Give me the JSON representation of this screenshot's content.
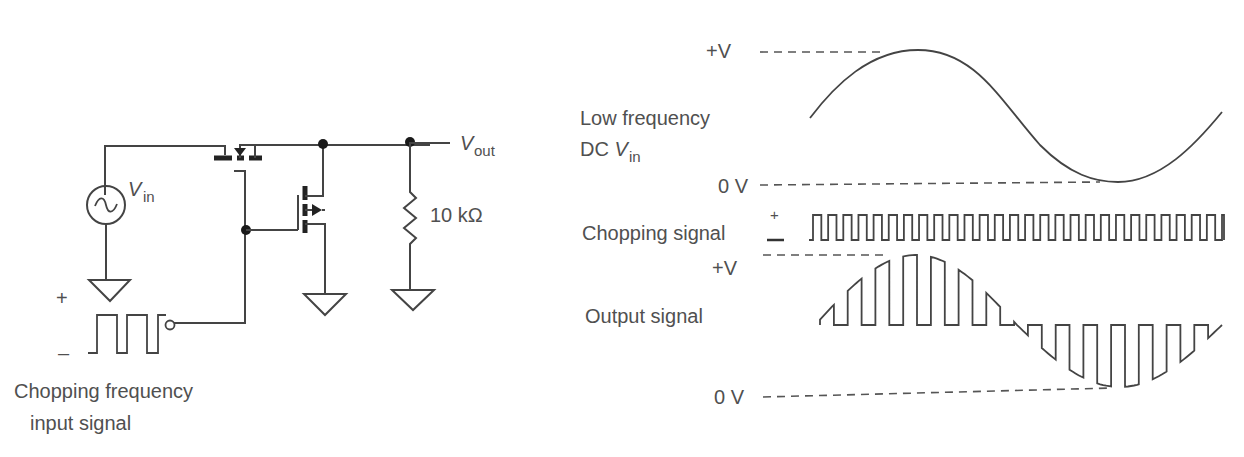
{
  "circuit": {
    "vin_label": "V",
    "vin_sub": "in",
    "vout_label": "V",
    "vout_sub": "out",
    "resistor_label": "10 kΩ",
    "input_plus": "+",
    "input_minus": "–",
    "chopping_input_caption_line1": "Chopping frequency",
    "chopping_input_caption_line2": "input signal",
    "components": [
      "ac-voltage-source",
      "p-channel-mosfet-series",
      "n-channel-mosfet-shunt",
      "resistor-10k",
      "ground-x3",
      "square-wave-source"
    ]
  },
  "waveforms": {
    "top": {
      "plus_v": "+V",
      "zero_v": "0 V",
      "label_line1": "Low frequency",
      "label_line2_prefix": "DC ",
      "label_line2_v": "V",
      "label_line2_sub": "in"
    },
    "chopping": {
      "label": "Chopping signal",
      "plus": "+",
      "minus": "–",
      "pulse_count": 27
    },
    "output": {
      "plus_v": "+V",
      "zero_v": "0 V",
      "label": "Output signal"
    }
  },
  "chart_data": [
    {
      "type": "line",
      "title": "Low frequency DC Vin",
      "ylabel": "Voltage",
      "y_ticks": [
        "0 V",
        "+V"
      ],
      "description": "Sine wave starting near mid-level, peak at +V, trough at 0 V, rising back toward mid-level",
      "series": [
        {
          "name": "Vin",
          "shape": "sine",
          "cycles": 1.0
        }
      ]
    },
    {
      "type": "line",
      "title": "Chopping signal",
      "description": "High-frequency square wave",
      "series": [
        {
          "name": "Chopping signal",
          "shape": "square",
          "pulses": 27
        }
      ]
    },
    {
      "type": "line",
      "title": "Output signal",
      "y_ticks": [
        "0 V",
        "+V"
      ],
      "description": "Chopped sine: pulses follow Vin envelope, upper pulses during positive half, lower pulses during negative half",
      "series": [
        {
          "name": "Vout",
          "shape": "chopped-sine"
        }
      ]
    }
  ]
}
